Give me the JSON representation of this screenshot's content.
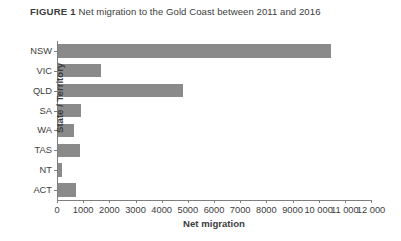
{
  "figure": {
    "label": "FIGURE 1",
    "caption": "Net migration to the Gold Coast between 2011 and 2016"
  },
  "colors": {
    "bar": "#8a8a8a",
    "axis": "#7f7f7f",
    "text": "#3d3d3d"
  },
  "chart_data": {
    "type": "bar",
    "orientation": "horizontal",
    "title": "Net migration to the Gold Coast between 2011 and 2016",
    "xlabel": "Net migration",
    "ylabel": "State / Territory",
    "categories": [
      "NSW",
      "VIC",
      "QLD",
      "SA",
      "WA",
      "TAS",
      "NT",
      "ACT"
    ],
    "values": [
      10450,
      1640,
      4770,
      880,
      610,
      840,
      150,
      680
    ],
    "xlim": [
      0,
      12000
    ],
    "xticks": [
      0,
      1000,
      2000,
      3000,
      4000,
      5000,
      6000,
      7000,
      8000,
      9000,
      10000,
      11000,
      12000
    ],
    "xtick_labels": [
      "0",
      "1000",
      "2000",
      "3000",
      "4000",
      "5000",
      "6000",
      "7000",
      "8000",
      "9000",
      "10 000",
      "11 000",
      "12 000"
    ],
    "grid": false,
    "legend": null
  }
}
